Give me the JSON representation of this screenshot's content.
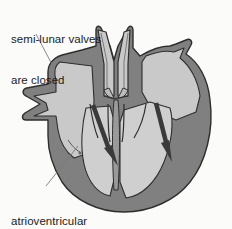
{
  "figure": {
    "background_color": "#fbfbfa"
  },
  "labels": {
    "semilunar": {
      "line1": "semi-lunar valves",
      "line2": "are closed",
      "name": "semi-lunar valves are closed"
    },
    "atrioventricular": {
      "line1": "atrioventricular",
      "line2": "valves are open",
      "name": "atrioventricular valves are open"
    }
  },
  "colors": {
    "text": "#1b1b1b",
    "myocardium": "#808080",
    "chamber": "#c9c9c9",
    "chamber_light": "#d2d2d2",
    "outline": "#2e2e2e",
    "arrow": "#3a3a3a",
    "leader_line": "#6a6a6a",
    "background": "#fbfbfa"
  },
  "diagram": {
    "type": "anatomical-cross-section",
    "organ": "heart",
    "arrows": [
      {
        "name": "left-ventricle-inflow-arrow",
        "direction": "down-right",
        "meaning": "blood flow from atrium into ventricle"
      },
      {
        "name": "right-ventricle-inflow-arrow",
        "direction": "down-right",
        "meaning": "blood flow from atrium into ventricle"
      }
    ],
    "structures": [
      "great vessels",
      "semi-lunar valves",
      "atria",
      "atrioventricular valves",
      "ventricles",
      "interventricular septum",
      "vena cava stubs"
    ]
  }
}
